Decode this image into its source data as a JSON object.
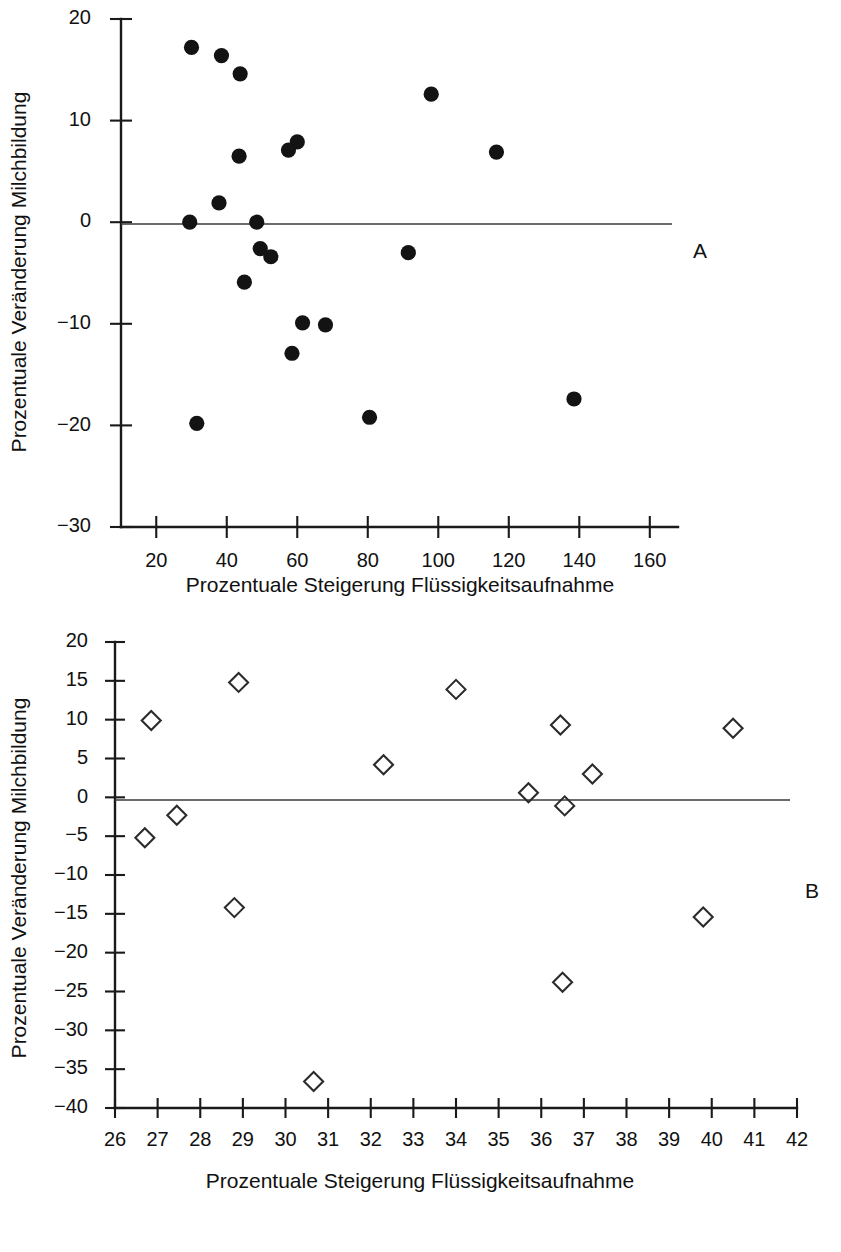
{
  "figure": {
    "panels": [
      {
        "id": "A",
        "panel_label": "A",
        "marker": "filled-circle"
      },
      {
        "id": "B",
        "panel_label": "B",
        "marker": "open-diamond"
      }
    ]
  },
  "chart_data": [
    {
      "type": "scatter",
      "panel": "A",
      "title": "",
      "xlabel": "Prozentuale Steigerung Flüssigkeitsaufnahme",
      "ylabel": "Prozentuale Veränderung Milchbildung",
      "marker": "filled-circle",
      "xlim": [
        10,
        168
      ],
      "ylim": [
        -30,
        20
      ],
      "xticks": [
        20,
        40,
        60,
        80,
        100,
        120,
        140,
        160
      ],
      "xticklabels": [
        "20",
        "40",
        "60",
        "80",
        "100",
        "120",
        "140",
        "160"
      ],
      "yticks": [
        20,
        10,
        0,
        -10,
        -20,
        -30
      ],
      "yticklabels": [
        "20",
        "10",
        "0",
        "−10",
        "−20",
        "−30"
      ],
      "grid": false,
      "legend": false,
      "reference_line_y": 0,
      "points": [
        {
          "x": 30.0,
          "y": 17.2
        },
        {
          "x": 38.5,
          "y": 16.4
        },
        {
          "x": 43.8,
          "y": 14.6
        },
        {
          "x": 98.0,
          "y": 12.6
        },
        {
          "x": 60.0,
          "y": 7.9
        },
        {
          "x": 57.5,
          "y": 7.1
        },
        {
          "x": 116.5,
          "y": 6.9
        },
        {
          "x": 43.5,
          "y": 6.5
        },
        {
          "x": 37.8,
          "y": 1.9
        },
        {
          "x": 29.5,
          "y": 0.0
        },
        {
          "x": 48.5,
          "y": 0.0
        },
        {
          "x": 49.5,
          "y": -2.6
        },
        {
          "x": 52.5,
          "y": -3.4
        },
        {
          "x": 91.5,
          "y": -3.0
        },
        {
          "x": 45.0,
          "y": -5.9
        },
        {
          "x": 61.5,
          "y": -9.9
        },
        {
          "x": 68.0,
          "y": -10.1
        },
        {
          "x": 58.5,
          "y": -12.9
        },
        {
          "x": 138.5,
          "y": -17.4
        },
        {
          "x": 80.5,
          "y": -19.2
        },
        {
          "x": 31.5,
          "y": -19.8
        }
      ]
    },
    {
      "type": "scatter",
      "panel": "B",
      "title": "",
      "xlabel": "Prozentuale Steigerung Flüssigkeitsaufnahme",
      "ylabel": "Prozentuale Veränderung Milchbildung",
      "marker": "open-diamond",
      "xlim": [
        26,
        42
      ],
      "ylim": [
        -40,
        20
      ],
      "xticks": [
        26,
        27,
        28,
        29,
        30,
        31,
        32,
        33,
        34,
        35,
        36,
        37,
        38,
        39,
        40,
        41,
        42
      ],
      "xticklabels": [
        "26",
        "27",
        "28",
        "29",
        "30",
        "31",
        "32",
        "33",
        "34",
        "35",
        "36",
        "37",
        "38",
        "39",
        "40",
        "41",
        "42"
      ],
      "yticks": [
        20,
        15,
        10,
        5,
        0,
        -5,
        -10,
        -15,
        -20,
        -25,
        -30,
        -35,
        -40
      ],
      "yticklabels": [
        "20",
        "15",
        "10",
        "5",
        "0",
        "−5",
        "−10",
        "−15",
        "−20",
        "−25",
        "−30",
        "−35",
        "−40"
      ],
      "grid": false,
      "legend": false,
      "reference_line_y": 0,
      "points": [
        {
          "x": 26.85,
          "y": 9.9
        },
        {
          "x": 28.9,
          "y": 14.8
        },
        {
          "x": 34.0,
          "y": 13.9
        },
        {
          "x": 36.45,
          "y": 9.3
        },
        {
          "x": 40.5,
          "y": 8.9
        },
        {
          "x": 32.3,
          "y": 4.2
        },
        {
          "x": 37.2,
          "y": 3.0
        },
        {
          "x": 35.7,
          "y": 0.6
        },
        {
          "x": 36.55,
          "y": -1.1
        },
        {
          "x": 27.45,
          "y": -2.3
        },
        {
          "x": 26.7,
          "y": -5.2
        },
        {
          "x": 28.8,
          "y": -14.2
        },
        {
          "x": 39.8,
          "y": -15.4
        },
        {
          "x": 36.5,
          "y": -23.8
        },
        {
          "x": 30.66,
          "y": -36.6
        }
      ]
    }
  ],
  "colors": {
    "marker_fill": "#131313",
    "marker_stroke": "#2b2b2b",
    "axis": "#1a1a1a",
    "background": "#ffffff"
  }
}
